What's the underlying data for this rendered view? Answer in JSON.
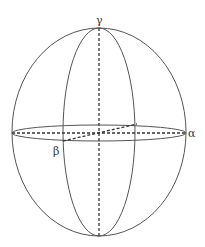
{
  "diagram": {
    "type": "ellipsoid with principal axes",
    "labels": {
      "gamma": "γ",
      "alpha": "α",
      "beta": "β"
    },
    "stroke_color": "#555555",
    "dash_color": "#333333"
  }
}
